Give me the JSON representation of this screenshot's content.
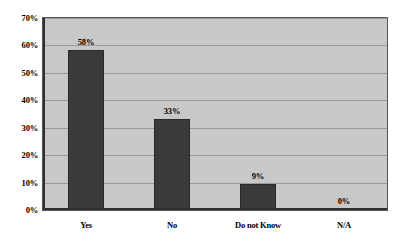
{
  "chart_data": {
    "type": "bar",
    "title": "",
    "subtitle": "",
    "xlabel": "",
    "ylabel": "",
    "categories": [
      "Yes",
      "No",
      "Do not Know",
      "N/A"
    ],
    "values": [
      58,
      33,
      9,
      0
    ],
    "value_labels": [
      "58%",
      "33%",
      "9%",
      "0%"
    ],
    "ylim": [
      0,
      70
    ],
    "ytick_labels": [
      "0%",
      "10%",
      "20%",
      "30%",
      "40%",
      "50%",
      "60%",
      "70%"
    ],
    "ytick_values": [
      0,
      10,
      20,
      30,
      40,
      50,
      60,
      70
    ],
    "grid": true,
    "legend": false,
    "legend_position": "none",
    "series": [
      {
        "name": "",
        "values": [
          58,
          33,
          9,
          0
        ]
      }
    ]
  },
  "colors": {
    "bar_fill": "#3a3a3a",
    "bar_border": "#2a2a2a",
    "plot_background": "#c8c8c8",
    "gridline": "#9a9a9e",
    "axis": "#2e2e33",
    "text": "#000000",
    "page_background": "#ffffff"
  }
}
